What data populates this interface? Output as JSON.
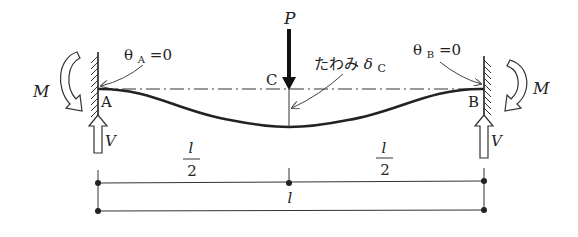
{
  "diagram": {
    "type": "fixed-fixed beam with central point load",
    "load": {
      "label": "P"
    },
    "midpoint": {
      "label": "C"
    },
    "deflection": {
      "label": "たわみ",
      "symbol": "δ",
      "subscript": "C"
    },
    "support_a": {
      "label": "A",
      "rotation_symbol": "θ",
      "rotation_subscript": "A",
      "rotation_value": "=0",
      "moment_label": "M",
      "reaction_label": "V"
    },
    "support_b": {
      "label": "B",
      "rotation_symbol": "θ",
      "rotation_subscript": "B",
      "rotation_value": "=0",
      "moment_label": "M",
      "reaction_label": "V"
    },
    "dimensions": {
      "left_half": {
        "numerator": "l",
        "denominator": "2"
      },
      "right_half": {
        "numerator": "l",
        "denominator": "2"
      },
      "total": "l"
    },
    "colors": {
      "line": "#222222",
      "background": "#ffffff"
    }
  }
}
